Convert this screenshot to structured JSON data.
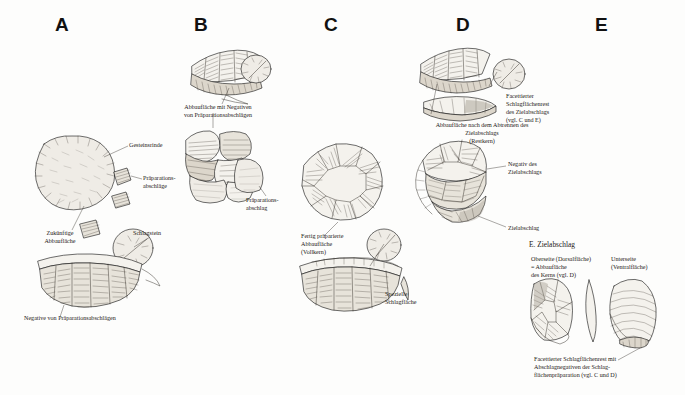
{
  "figure": {
    "background_color": "#fdfdfc",
    "ink_color": "#141414",
    "columns": [
      {
        "id": "A",
        "label": "A",
        "x": 62
      },
      {
        "id": "B",
        "label": "B",
        "x": 200
      },
      {
        "id": "C",
        "label": "C",
        "x": 330
      },
      {
        "id": "D",
        "label": "D",
        "x": 462
      },
      {
        "id": "E",
        "label": "E",
        "x": 600
      }
    ]
  },
  "labels": {
    "a_cortex": "Gesteinsrinde",
    "a_preparation_flakes": "Präparations-\nabschläge",
    "a_hammerstone": "Schlagstein",
    "a_future_surface": "Zukünftige\nAbbaufläche",
    "a_negatives": "Negative von Präparationsabschlägen",
    "b_surface_negatives": "Abbaufläche mit Negativen\nvon Präparationsabschlägen",
    "b_preparation_flake": "Präparations-\nabschlag",
    "c_prepared_surface": "Fertig präparierte\nAbbaufläche\n(Vollkern)",
    "c_special_platform": "Spezielle\nSchlagfläche",
    "d_faceted_butt": "Facettierter\nSchlagflächenrest\ndes Zielabschlags\n(vgl. C und E)",
    "d_surface_after": "Abbaufläche nach dem Abtrennen des\nZielabschlags\n(Restkern)",
    "d_negative": "Negativ des\nZielabschlags",
    "d_target_flake": "Zielabschlag",
    "e_heading": "E. Zielabschlag",
    "e_dorsal": "Oberseite (Dorsalfläche)\n= Abbaufläche\ndes Kerns (vgl. D)",
    "e_ventral": "Unterseite\n(Ventralfläche)",
    "e_caption": "Facettierter Schlagflächenrest mit\nAbschlagnegativen der Schlag-\nflächenpräparation (vgl. C und D)"
  }
}
